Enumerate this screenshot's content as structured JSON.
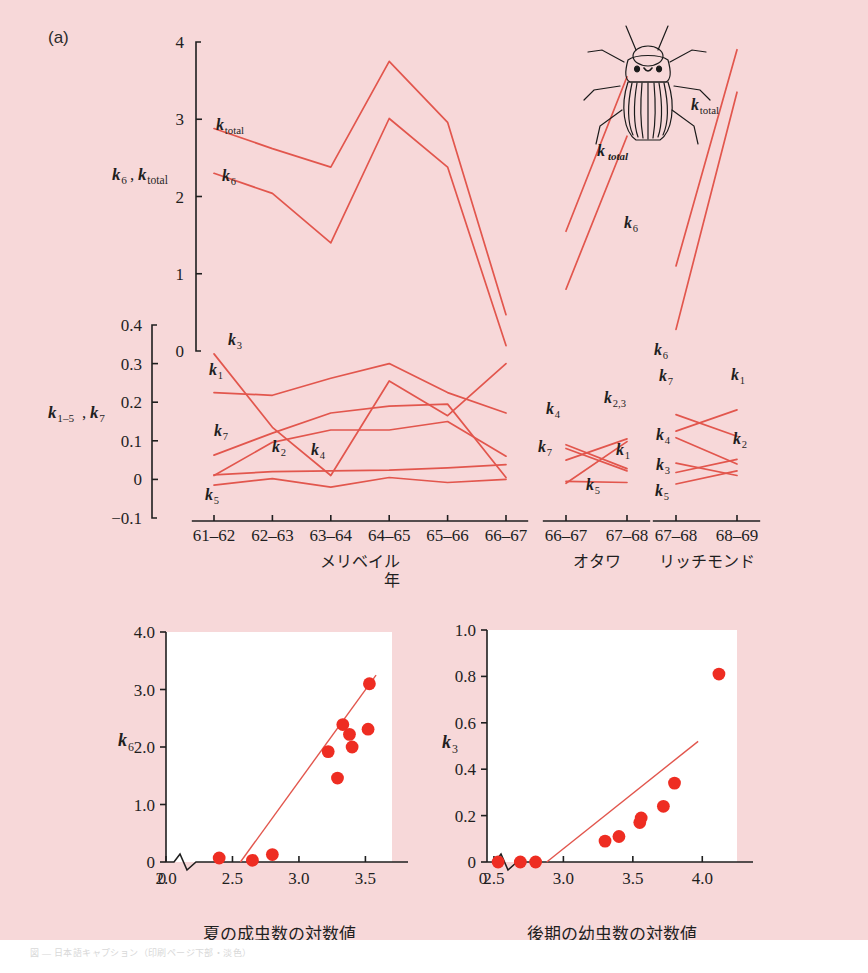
{
  "figure": {
    "panel_a_tag": "(a)",
    "panel_b_tag": "(b)",
    "caption_text": "図 ― 日本語キャプション（印刷ページ下部・淡色）",
    "colors": {
      "background": "#f7d8d9",
      "line": "#e2564d",
      "dot": "#ee2d22",
      "axis": "#1f1f1f",
      "plot_face": "#ffffff"
    }
  },
  "panel_a": {
    "tag": "(a)",
    "y_axis_upper": {
      "label": "k₆, k_total",
      "label_parts": {
        "a": "k",
        "a_sub": "6",
        "b": "k",
        "b_sub": "total"
      },
      "ticks": [
        "0",
        "1",
        "2",
        "3",
        "4"
      ],
      "range": [
        0,
        4
      ]
    },
    "y_axis_lower": {
      "label": "k₁₋₅, k₇",
      "label_parts": {
        "a": "k",
        "a_sub": "1–5",
        "b": "k",
        "b_sub": "7"
      },
      "ticks": [
        "-0.1",
        "0",
        "0.1",
        "0.2",
        "0.3",
        "0.4"
      ],
      "range": [
        -0.1,
        0.4
      ]
    },
    "x_axis_title": "年",
    "sites": [
      {
        "name": "メリベイル",
        "ticks": [
          "61-62",
          "62-63",
          "63-64",
          "64-65",
          "65-66",
          "66-67"
        ]
      },
      {
        "name": "オタワ",
        "ticks": [
          "66-67",
          "67-68"
        ]
      },
      {
        "name": "リッチモンド",
        "ticks": [
          "67-68",
          "68-69"
        ]
      }
    ],
    "beetle_label": "k_total",
    "series_labels": [
      "k_total",
      "k₆",
      "k₃",
      "k₁",
      "k₇",
      "k₂",
      "k₄",
      "k₅",
      "k₂,₃"
    ]
  },
  "chart_data": [
    {
      "type": "line",
      "title": "(a) Merivale k-values",
      "panel": "a-merivale",
      "xlabel": "年",
      "ylabel_upper": "k6, ktotal",
      "ylabel_lower": "k1-5, k7",
      "categories": [
        "61-62",
        "62-63",
        "63-64",
        "64-65",
        "65-66",
        "66-67"
      ],
      "ylim_upper": [
        0,
        4
      ],
      "ylim_lower": [
        -0.1,
        0.4
      ],
      "grid": false,
      "legend": "inline-labels",
      "series": [
        {
          "name": "k_total",
          "axis": "upper",
          "values": [
            2.88,
            2.62,
            2.38,
            3.75,
            2.96,
            0.47
          ]
        },
        {
          "name": "k6",
          "axis": "upper",
          "values": [
            2.3,
            2.04,
            1.4,
            3.01,
            2.38,
            0.07
          ]
        },
        {
          "name": "k3",
          "axis": "lower",
          "values": [
            0.325,
            0.135,
            0.01,
            0.255,
            0.165,
            0.3
          ]
        },
        {
          "name": "k1",
          "axis": "lower",
          "values": [
            0.225,
            0.218,
            0.262,
            0.3,
            0.225,
            0.172
          ]
        },
        {
          "name": "k7",
          "axis": "lower",
          "values": [
            0.063,
            0.12,
            0.172,
            0.19,
            0.195,
            0.005
          ]
        },
        {
          "name": "k2",
          "axis": "lower",
          "values": [
            0.01,
            0.096,
            0.128,
            0.128,
            0.15,
            0.06
          ]
        },
        {
          "name": "k4",
          "axis": "lower",
          "values": [
            0.012,
            0.02,
            0.022,
            0.024,
            0.03,
            0.038
          ]
        },
        {
          "name": "k5",
          "axis": "lower",
          "values": [
            -0.015,
            0.002,
            -0.02,
            0.005,
            -0.008,
            0.0
          ]
        }
      ]
    },
    {
      "type": "line",
      "title": "(a) Ottawa k-values",
      "panel": "a-ottawa",
      "categories": [
        "66-67",
        "67-68"
      ],
      "ylim_upper": [
        0,
        4
      ],
      "ylim_lower": [
        -0.1,
        0.4
      ],
      "series": [
        {
          "name": "k_total",
          "axis": "upper",
          "values": [
            1.55,
            3.55
          ]
        },
        {
          "name": "k6",
          "axis": "upper",
          "values": [
            0.8,
            2.78
          ]
        },
        {
          "name": "k4",
          "axis": "lower",
          "values": [
            0.08,
            0.022
          ]
        },
        {
          "name": "k7",
          "axis": "lower",
          "values": [
            0.05,
            0.105
          ]
        },
        {
          "name": "k2,3",
          "axis": "lower",
          "values": [
            -0.01,
            0.098
          ]
        },
        {
          "name": "k1",
          "axis": "lower",
          "values": [
            0.09,
            0.028
          ]
        },
        {
          "name": "k5",
          "axis": "lower",
          "values": [
            -0.005,
            -0.008
          ]
        }
      ]
    },
    {
      "type": "line",
      "title": "(a) Richmond k-values",
      "panel": "a-richmond",
      "categories": [
        "67-68",
        "68-69"
      ],
      "ylim_upper": [
        0,
        4
      ],
      "ylim_lower": [
        -0.1,
        0.4
      ],
      "series": [
        {
          "name": "k_total",
          "axis": "upper",
          "values": [
            1.1,
            3.9
          ]
        },
        {
          "name": "k6",
          "axis": "upper",
          "values": [
            0.28,
            3.35
          ]
        },
        {
          "name": "k7",
          "axis": "lower",
          "values": [
            0.168,
            0.112
          ]
        },
        {
          "name": "k1",
          "axis": "lower",
          "values": [
            0.125,
            0.18
          ]
        },
        {
          "name": "k4",
          "axis": "lower",
          "values": [
            0.108,
            0.04
          ]
        },
        {
          "name": "k2",
          "axis": "lower",
          "values": [
            0.018,
            0.052
          ]
        },
        {
          "name": "k3",
          "axis": "lower",
          "values": [
            0.042,
            0.01
          ]
        },
        {
          "name": "k5",
          "axis": "lower",
          "values": [
            -0.012,
            0.022
          ]
        }
      ]
    },
    {
      "type": "scatter",
      "panel": "b-left",
      "title": "(b) k6 vs log summer adults",
      "xlabel": "夏の成虫数の対数値",
      "ylabel": "k₆",
      "xticks": [
        "0",
        "2.0",
        "2.5",
        "3.0",
        "3.5"
      ],
      "yticks": [
        "0",
        "1.0",
        "2.0",
        "3.0",
        "4.0"
      ],
      "xlim": [
        2.0,
        3.7
      ],
      "ylim": [
        0,
        4.0
      ],
      "axis_break_x": true,
      "points": [
        {
          "x": 2.4,
          "y": 0.07
        },
        {
          "x": 2.65,
          "y": 0.03
        },
        {
          "x": 2.8,
          "y": 0.13
        },
        {
          "x": 3.22,
          "y": 1.92
        },
        {
          "x": 3.29,
          "y": 1.46
        },
        {
          "x": 3.33,
          "y": 2.39
        },
        {
          "x": 3.38,
          "y": 2.22
        },
        {
          "x": 3.4,
          "y": 2.0
        },
        {
          "x": 3.52,
          "y": 2.31
        },
        {
          "x": 3.53,
          "y": 3.1
        }
      ],
      "fit_line": {
        "x0": 2.56,
        "y0": 0.0,
        "x1": 3.58,
        "y1": 3.25
      }
    },
    {
      "type": "scatter",
      "panel": "b-right",
      "title": "(b) k3 vs log late larvae",
      "xlabel": "後期の幼虫数の対数値",
      "ylabel": "k₃",
      "xticks": [
        "0",
        "2.5",
        "3.0",
        "3.5",
        "4.0"
      ],
      "yticks": [
        "0",
        "0.2",
        "0.4",
        "0.6",
        "0.8",
        "1.0"
      ],
      "xlim": [
        2.45,
        4.25
      ],
      "ylim": [
        0,
        1.0
      ],
      "axis_break_x": true,
      "points": [
        {
          "x": 2.53,
          "y": 0.0
        },
        {
          "x": 2.69,
          "y": 0.0
        },
        {
          "x": 2.8,
          "y": 0.0
        },
        {
          "x": 3.3,
          "y": 0.09
        },
        {
          "x": 3.4,
          "y": 0.11
        },
        {
          "x": 3.55,
          "y": 0.17
        },
        {
          "x": 3.56,
          "y": 0.19
        },
        {
          "x": 3.72,
          "y": 0.24
        },
        {
          "x": 3.8,
          "y": 0.34
        },
        {
          "x": 4.12,
          "y": 0.81
        }
      ],
      "fit_line": {
        "x0": 2.88,
        "y0": 0.0,
        "x1": 3.97,
        "y1": 0.52
      }
    }
  ]
}
